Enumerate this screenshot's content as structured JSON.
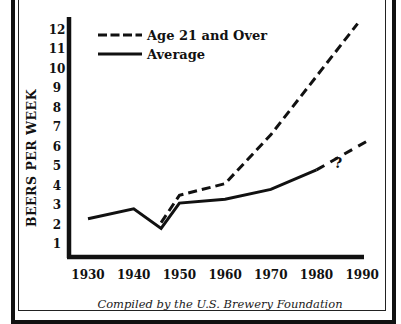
{
  "chart_data": {
    "type": "line",
    "title": "",
    "xlabel": "",
    "ylabel": "BEERS PER WEEK",
    "x_ticks": [
      "1930",
      "1940",
      "1950",
      "1960",
      "1970",
      "1980",
      "1990"
    ],
    "y_ticks": [
      "1",
      "2",
      "3",
      "4",
      "5",
      "6",
      "7",
      "8",
      "9",
      "10",
      "11",
      "12"
    ],
    "xlim": [
      1930,
      1990
    ],
    "ylim": [
      0.5,
      12.5
    ],
    "grid": false,
    "legend_position": "upper-left",
    "series": [
      {
        "name": "Age 21 and Over",
        "style": "dashed",
        "x": [
          1946,
          1950,
          1960,
          1970,
          1980,
          1989
        ],
        "values": [
          2.1,
          3.5,
          4.1,
          6.6,
          9.6,
          12.3
        ]
      },
      {
        "name": "Average",
        "style": "solid",
        "x": [
          1930,
          1940,
          1946,
          1950,
          1960,
          1970,
          1980
        ],
        "values": [
          2.3,
          2.8,
          1.8,
          3.1,
          3.3,
          3.8,
          4.8
        ]
      },
      {
        "name": "Average (projected)",
        "style": "dashed",
        "x": [
          1980,
          1992
        ],
        "values": [
          4.8,
          6.4
        ]
      }
    ],
    "annotations": [
      {
        "text": "?",
        "x": 1984,
        "y": 5.2
      }
    ],
    "caption": "Compiled by the U.S. Brewery Foundation"
  },
  "legend": {
    "age21_label": "Age 21 and Over",
    "average_label": "Average"
  },
  "axis": {
    "ylabel": "BEERS PER WEEK"
  },
  "annotation": {
    "question_mark": "?"
  },
  "caption": "Compiled by the U.S. Brewery Foundation"
}
